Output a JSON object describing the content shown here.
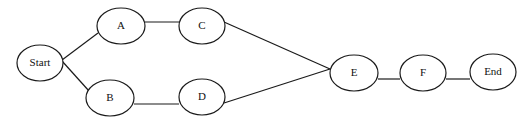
{
  "diagram": {
    "type": "network-flow",
    "nodes": [
      {
        "id": "start",
        "label": "Start",
        "cx": 40,
        "cy": 63,
        "rx": 23,
        "ry": 18
      },
      {
        "id": "a",
        "label": "A",
        "cx": 121,
        "cy": 26,
        "rx": 24,
        "ry": 18
      },
      {
        "id": "b",
        "label": "B",
        "cx": 110,
        "cy": 98,
        "rx": 24,
        "ry": 18
      },
      {
        "id": "c",
        "label": "C",
        "cx": 202,
        "cy": 26,
        "rx": 23,
        "ry": 18
      },
      {
        "id": "d",
        "label": "D",
        "cx": 202,
        "cy": 97,
        "rx": 23,
        "ry": 18
      },
      {
        "id": "e",
        "label": "E",
        "cx": 354,
        "cy": 73,
        "rx": 24,
        "ry": 18
      },
      {
        "id": "f",
        "label": "F",
        "cx": 423,
        "cy": 73,
        "rx": 23,
        "ry": 18
      },
      {
        "id": "end",
        "label": "End",
        "cx": 493,
        "cy": 72,
        "rx": 23,
        "ry": 18
      }
    ],
    "edges": [
      {
        "from": "start",
        "to": "a",
        "x1": 62,
        "y1": 60,
        "x2": 98,
        "y2": 33
      },
      {
        "from": "start",
        "to": "b",
        "x1": 62,
        "y1": 61,
        "x2": 89,
        "y2": 91
      },
      {
        "from": "a",
        "to": "c",
        "x1": 145,
        "y1": 22,
        "x2": 179,
        "y2": 22
      },
      {
        "from": "b",
        "to": "d",
        "x1": 134,
        "y1": 104,
        "x2": 179,
        "y2": 104
      },
      {
        "from": "c",
        "to": "e",
        "x1": 224,
        "y1": 22,
        "x2": 330,
        "y2": 69
      },
      {
        "from": "d",
        "to": "e",
        "x1": 224,
        "y1": 103,
        "x2": 330,
        "y2": 69
      },
      {
        "from": "e",
        "to": "f",
        "x1": 378,
        "y1": 79,
        "x2": 400,
        "y2": 79
      },
      {
        "from": "f",
        "to": "end",
        "x1": 446,
        "y1": 79,
        "x2": 470,
        "y2": 79
      }
    ]
  }
}
